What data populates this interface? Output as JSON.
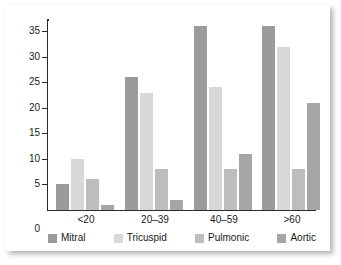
{
  "chart_data": {
    "type": "bar",
    "title": "",
    "subtitle": "",
    "xlabel": "",
    "ylabel": "",
    "ylim": [
      0,
      37
    ],
    "yticks": [
      0,
      5,
      10,
      15,
      20,
      25,
      30,
      35
    ],
    "ytick_labels": [
      "0",
      "5",
      "10",
      "15",
      "20",
      "25",
      "30",
      "35"
    ],
    "grid": false,
    "legend_position": "bottom",
    "categories": [
      "<20",
      "20–39",
      "40–59",
      ">60"
    ],
    "series": [
      {
        "name": "Mitral",
        "color": "#9b9b9b",
        "values": [
          5,
          26,
          36,
          36
        ]
      },
      {
        "name": "Tricuspid",
        "color": "#d8d8d8",
        "values": [
          10,
          23,
          24,
          32
        ]
      },
      {
        "name": "Pulmonic",
        "color": "#bdbdbd",
        "values": [
          6,
          8,
          8,
          8
        ]
      },
      {
        "name": "Aortic",
        "color": "#a6a6a6",
        "values": [
          1,
          2,
          11,
          21
        ]
      }
    ]
  },
  "legend": {
    "items": [
      {
        "label": "Mitral"
      },
      {
        "label": "Tricuspid"
      },
      {
        "label": "Pulmonic"
      },
      {
        "label": "Aortic"
      }
    ]
  }
}
